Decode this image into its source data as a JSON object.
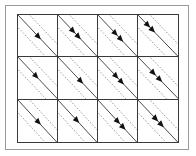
{
  "figure": {
    "title": "",
    "caption": "",
    "background_color": "#ffffff",
    "outer_frame_color": "#9a9a9a",
    "grid_line_color": "#3a3a3a",
    "solid_diagonal_color": "#333333",
    "dashed_diagonal_color": "#777777",
    "arrow_color": "#111111"
  },
  "grid": {
    "columns": 4,
    "rows": 3,
    "cell_count": 12,
    "diagonal_direction": "top-left-to-bottom-right",
    "lines_per_cell": 3,
    "line_styles": [
      "dashed",
      "solid",
      "dashed"
    ],
    "cells": [
      {
        "id": "r1c1",
        "row": 1,
        "col": 1,
        "arrow_count": 1,
        "arrow_positions": [
          0.5
        ],
        "label": ""
      },
      {
        "id": "r1c2",
        "row": 1,
        "col": 2,
        "arrow_count": 2,
        "arrow_positions": [
          0.36,
          0.5
        ],
        "label": ""
      },
      {
        "id": "r1c3",
        "row": 1,
        "col": 3,
        "arrow_count": 2,
        "arrow_positions": [
          0.42,
          0.56
        ],
        "label": ""
      },
      {
        "id": "r1c4",
        "row": 1,
        "col": 4,
        "arrow_count": 2,
        "arrow_positions": [
          0.22,
          0.34
        ],
        "label": ""
      },
      {
        "id": "r2c1",
        "row": 2,
        "col": 1,
        "arrow_count": 1,
        "arrow_positions": [
          0.44
        ],
        "label": ""
      },
      {
        "id": "r2c2",
        "row": 2,
        "col": 2,
        "arrow_count": 1,
        "arrow_positions": [
          0.56
        ],
        "label": ""
      },
      {
        "id": "r2c3",
        "row": 2,
        "col": 3,
        "arrow_count": 2,
        "arrow_positions": [
          0.44,
          0.58
        ],
        "label": ""
      },
      {
        "id": "r2c4",
        "row": 2,
        "col": 4,
        "arrow_count": 2,
        "arrow_positions": [
          0.36,
          0.52
        ],
        "label": ""
      },
      {
        "id": "r3c1",
        "row": 3,
        "col": 1,
        "arrow_count": 1,
        "arrow_positions": [
          0.5
        ],
        "label": ""
      },
      {
        "id": "r3c2",
        "row": 3,
        "col": 2,
        "arrow_count": 1,
        "arrow_positions": [
          0.46
        ],
        "label": ""
      },
      {
        "id": "r3c3",
        "row": 3,
        "col": 3,
        "arrow_count": 2,
        "arrow_positions": [
          0.48,
          0.62
        ],
        "label": ""
      },
      {
        "id": "r3c4",
        "row": 3,
        "col": 4,
        "arrow_count": 2,
        "arrow_positions": [
          0.42,
          0.56
        ],
        "label": ""
      }
    ]
  }
}
